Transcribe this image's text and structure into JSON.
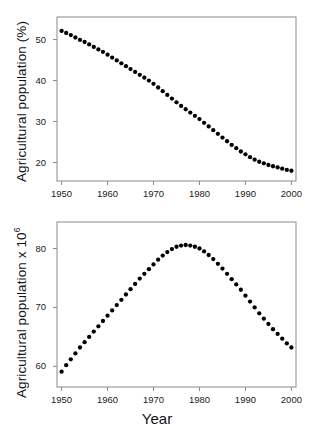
{
  "figure": {
    "background": "#ffffff",
    "marker_color": "#000000",
    "axis_color": "#8a8a8a",
    "xaxis_title": "Year"
  },
  "chart_data": [
    {
      "type": "scatter",
      "panel": "top",
      "title": "",
      "xlabel": "Year",
      "ylabel": "Agricultural population (%)",
      "xlim": [
        1949,
        2001
      ],
      "ylim": [
        15.5,
        55.5
      ],
      "xticks": [
        1950,
        1960,
        1970,
        1980,
        1990,
        2000
      ],
      "xticklabels": [
        "1950",
        "1960",
        "1970",
        "1980",
        "1990",
        "2000"
      ],
      "yticks": [
        20,
        30,
        40,
        50
      ],
      "yticklabels": [
        "20",
        "30",
        "40",
        "50"
      ],
      "grid": false,
      "legend": "none",
      "x": [
        1950,
        1951,
        1952,
        1953,
        1954,
        1955,
        1956,
        1957,
        1958,
        1959,
        1960,
        1961,
        1962,
        1963,
        1964,
        1965,
        1966,
        1967,
        1968,
        1969,
        1970,
        1971,
        1972,
        1973,
        1974,
        1975,
        1976,
        1977,
        1978,
        1979,
        1980,
        1981,
        1982,
        1983,
        1984,
        1985,
        1986,
        1987,
        1988,
        1989,
        1990,
        1991,
        1992,
        1993,
        1994,
        1995,
        1996,
        1997,
        1998,
        1999,
        2000
      ],
      "values": [
        52.1,
        51.6,
        51.1,
        50.5,
        49.9,
        49.4,
        48.8,
        48.2,
        47.6,
        47.0,
        46.3,
        45.6,
        44.9,
        44.2,
        43.5,
        42.8,
        42.1,
        41.4,
        40.7,
        40.0,
        39.2,
        38.3,
        37.4,
        36.5,
        35.6,
        34.7,
        33.8,
        33.0,
        32.2,
        31.4,
        30.6,
        29.7,
        28.8,
        27.9,
        27.0,
        26.1,
        25.2,
        24.3,
        23.5,
        22.7,
        22.0,
        21.3,
        20.7,
        20.2,
        19.8,
        19.4,
        19.1,
        18.8,
        18.5,
        18.2,
        18.0
      ]
    },
    {
      "type": "scatter",
      "panel": "bottom",
      "title": "",
      "xlabel": "Year",
      "ylabel": "Agricultural population x 10⁶",
      "ylabel_base": "Agricultural population  x 10",
      "ylabel_exponent": "6",
      "xlim": [
        1949,
        2001
      ],
      "ylim": [
        56.5,
        84.5
      ],
      "xticks": [
        1950,
        1960,
        1970,
        1980,
        1990,
        2000
      ],
      "xticklabels": [
        "1950",
        "1960",
        "1970",
        "1980",
        "1990",
        "2000"
      ],
      "yticks": [
        60,
        70,
        80
      ],
      "yticklabels": [
        "60",
        "70",
        "80"
      ],
      "grid": false,
      "legend": "none",
      "x": [
        1950,
        1951,
        1952,
        1953,
        1954,
        1955,
        1956,
        1957,
        1958,
        1959,
        1960,
        1961,
        1962,
        1963,
        1964,
        1965,
        1966,
        1967,
        1968,
        1969,
        1970,
        1971,
        1972,
        1973,
        1974,
        1975,
        1976,
        1977,
        1978,
        1979,
        1980,
        1981,
        1982,
        1983,
        1984,
        1985,
        1986,
        1987,
        1988,
        1989,
        1990,
        1991,
        1992,
        1993,
        1994,
        1995,
        1996,
        1997,
        1998,
        1999,
        2000
      ],
      "values": [
        59.1,
        60.2,
        61.2,
        62.2,
        63.2,
        64.1,
        65.0,
        65.9,
        66.8,
        67.7,
        68.6,
        69.5,
        70.4,
        71.3,
        72.2,
        73.1,
        74.0,
        74.9,
        75.7,
        76.5,
        77.3,
        78.1,
        78.8,
        79.4,
        79.9,
        80.3,
        80.5,
        80.6,
        80.5,
        80.3,
        80.0,
        79.5,
        78.9,
        78.2,
        77.4,
        76.6,
        75.7,
        74.8,
        73.9,
        73.0,
        72.0,
        71.0,
        70.0,
        69.0,
        68.1,
        67.2,
        66.3,
        65.5,
        64.7,
        63.9,
        63.2
      ]
    }
  ]
}
